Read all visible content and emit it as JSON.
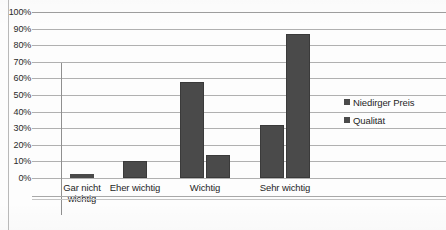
{
  "chart_data": {
    "type": "bar",
    "title": "",
    "subtitle": "",
    "xlabel": "",
    "ylabel": "",
    "ylim": [
      0,
      100
    ],
    "ytick_labels": [
      "100%",
      "90%",
      "80%",
      "70%",
      "60%",
      "50%",
      "40%",
      "30%",
      "20%",
      "10%",
      "0%"
    ],
    "ytick_values": [
      100,
      90,
      80,
      70,
      60,
      50,
      40,
      30,
      20,
      10,
      0
    ],
    "grid": true,
    "legend_position": "right",
    "categories": [
      "Gar nicht wichtig",
      "Eher wichtig",
      "Wichtig",
      "Sehr wichtig"
    ],
    "series": [
      {
        "name": "Niedirger Preis",
        "color": "#4a4a4a",
        "values": [
          1,
          10,
          58,
          32
        ]
      },
      {
        "name": "Qualität",
        "color": "#4a4a4a",
        "values": [
          0,
          0,
          14,
          87
        ]
      }
    ]
  },
  "legend": {
    "items": [
      {
        "label": "Niedirger Preis"
      },
      {
        "label": "Qualität"
      }
    ]
  },
  "axis": {
    "y_labels": [
      "100%",
      "90%",
      "80%",
      "70%",
      "60%",
      "50%",
      "40%",
      "30%",
      "20%",
      "10%",
      "0%"
    ]
  },
  "categories": [
    {
      "line1": "Gar nicht",
      "line2": "wichtig"
    },
    {
      "line1": "Eher wichtig",
      "line2": ""
    },
    {
      "line1": "Wichtig",
      "line2": ""
    },
    {
      "line1": "Sehr wichtig",
      "line2": ""
    }
  ],
  "colors": {
    "bar": "#4a4a4a",
    "grid": "#9d9d9d",
    "text": "#1f1f1f"
  }
}
